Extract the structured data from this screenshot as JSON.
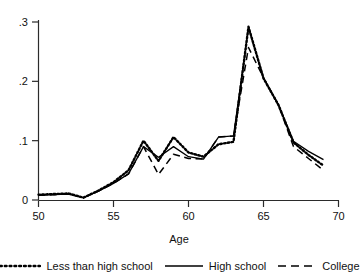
{
  "chart_data": {
    "type": "line",
    "title": "",
    "subtitle": "",
    "xlabel": "Age",
    "ylabel": "",
    "xlim": [
      50,
      70
    ],
    "ylim": [
      0,
      0.3
    ],
    "grid": false,
    "legend_position": "bottom",
    "xticks": [
      50,
      55,
      60,
      65,
      70
    ],
    "xtick_labels": [
      "50",
      "55",
      "60",
      "65",
      "70"
    ],
    "yticks": [
      0,
      0.1,
      0.2,
      0.3
    ],
    "ytick_labels": [
      "0",
      ".1",
      ".2",
      ".3"
    ],
    "x": [
      50,
      51,
      52,
      53,
      54,
      55,
      56,
      57,
      58,
      59,
      60,
      61,
      62,
      63,
      64,
      65,
      66,
      67,
      68,
      69
    ],
    "series": [
      {
        "name": "Less than high school",
        "style": "dotted",
        "color": "#000000",
        "values": [
          0.009,
          0.01,
          0.011,
          0.004,
          0.016,
          0.03,
          0.05,
          0.1,
          0.066,
          0.106,
          0.08,
          0.073,
          0.094,
          0.098,
          0.292,
          0.205,
          0.16,
          0.097,
          0.076,
          0.058
        ]
      },
      {
        "name": "High school",
        "style": "solid",
        "color": "#000000",
        "values": [
          0.008,
          0.009,
          0.01,
          0.004,
          0.015,
          0.028,
          0.044,
          0.09,
          0.072,
          0.09,
          0.073,
          0.069,
          0.106,
          0.108,
          0.29,
          0.206,
          0.16,
          0.099,
          0.082,
          0.068
        ]
      },
      {
        "name": "College",
        "style": "dashed",
        "color": "#000000",
        "values": [
          0.008,
          0.009,
          0.01,
          0.004,
          0.015,
          0.028,
          0.044,
          0.09,
          0.043,
          0.077,
          0.07,
          0.069,
          0.106,
          0.108,
          0.257,
          0.206,
          0.16,
          0.09,
          0.07,
          0.05
        ]
      }
    ],
    "legend": [
      {
        "label": "Less than high school",
        "style": "dotted"
      },
      {
        "label": "High school",
        "style": "solid"
      },
      {
        "label": "College",
        "style": "dashed"
      }
    ]
  }
}
